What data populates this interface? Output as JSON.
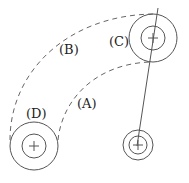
{
  "diagram": {
    "type": "gear-path-diagram",
    "labels": {
      "A": "(A)",
      "B": "(B)",
      "C": "(C)",
      "D": "(D)"
    },
    "elements": [
      {
        "id": "C",
        "kind": "concentric-circles",
        "center": [
          153,
          38
        ],
        "outer_radius": 24,
        "inner_radius": 12
      },
      {
        "id": "D",
        "kind": "concentric-circles",
        "center": [
          34,
          146
        ],
        "outer_radius": 24,
        "inner_radius": 12
      },
      {
        "id": "pivot",
        "kind": "concentric-circles",
        "center": [
          138,
          145
        ],
        "outer_radius": 15,
        "inner_radius": 9
      },
      {
        "id": "A",
        "kind": "dashed-arc",
        "description": "inner path from D to C"
      },
      {
        "id": "B",
        "kind": "dashed-arc",
        "description": "outer path from D to C"
      },
      {
        "id": "arm",
        "kind": "line",
        "from": [
          158,
          8
        ],
        "to": [
          137,
          147
        ]
      }
    ],
    "colors": {
      "line": "#555555",
      "background": "#ffffff"
    }
  }
}
